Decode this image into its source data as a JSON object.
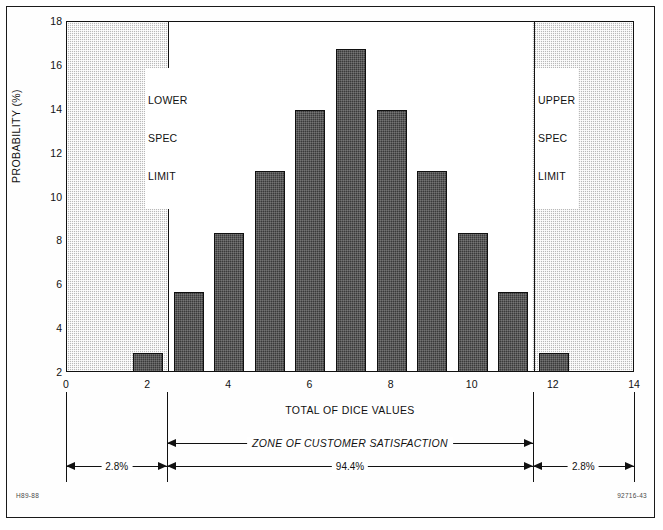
{
  "chart_data": {
    "type": "bar",
    "title": "",
    "xlabel": "TOTAL OF DICE VALUES",
    "ylabel": "PROBABILITY (%)",
    "categories": [
      2,
      3,
      4,
      5,
      6,
      7,
      8,
      9,
      10,
      11,
      12
    ],
    "values": [
      2.8,
      5.6,
      8.3,
      11.1,
      13.9,
      16.7,
      13.9,
      11.1,
      8.3,
      5.6,
      2.8
    ],
    "xlim": [
      0,
      14
    ],
    "ylim": [
      2,
      18
    ],
    "x_ticks": [
      0,
      2,
      4,
      6,
      8,
      10,
      12,
      14
    ],
    "y_ticks": [
      2,
      4,
      6,
      8,
      10,
      12,
      14,
      16,
      18
    ],
    "grid": false,
    "legend": "none",
    "bar_width": 0.75,
    "annotations": {
      "lower_spec_limit_x": 2.5,
      "upper_spec_limit_x": 11.5
    }
  },
  "axes": {
    "y_title": "PROBABILITY (%)",
    "x_title": "TOTAL OF DICE VALUES",
    "y_tick_labels": [
      "18",
      "16",
      "14",
      "12",
      "10",
      "8",
      "6",
      "4",
      "2"
    ],
    "x_tick_labels": [
      "0",
      "2",
      "4",
      "6",
      "8",
      "10",
      "12",
      "14"
    ]
  },
  "spec_limits": {
    "lower": {
      "line1": "LOWER",
      "line2": "SPEC",
      "line3": "LIMIT"
    },
    "upper": {
      "line1": "UPPER",
      "line2": "SPEC",
      "line3": "LIMIT"
    }
  },
  "dimensions": {
    "zone_label": "ZONE OF CUSTOMER SATISFACTION",
    "left_reject_pct": "2.8%",
    "center_accept_pct": "94.4%",
    "right_reject_pct": "2.8%"
  },
  "corner_codes": {
    "left": "H89-88",
    "right": "92716-43"
  }
}
